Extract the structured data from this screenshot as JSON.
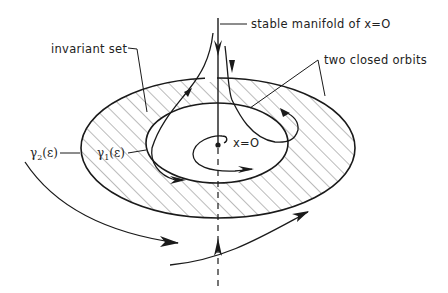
{
  "figure": {
    "type": "phase-portrait",
    "labels": {
      "stable_manifold": "stable manifold of x=O",
      "invariant_set": "invariant set",
      "closed_orbits": "two closed orbits",
      "gamma2": "γ",
      "gamma2_sub": "2",
      "gamma2_arg": "(ε)",
      "gamma1": "γ",
      "gamma1_sub": "1",
      "gamma1_arg": "(ε)",
      "origin": "x=O"
    },
    "colors": {
      "stroke": "#1a1a1a",
      "hatch": "#555555",
      "background": "#ffffff"
    }
  }
}
